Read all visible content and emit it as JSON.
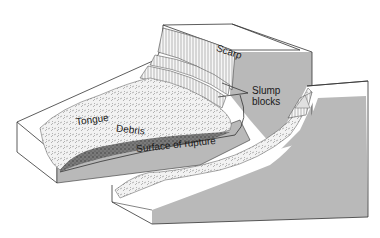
{
  "diagram": {
    "type": "block diagram",
    "labels": {
      "scarp": "Scarp",
      "slump_blocks_line1": "Slump",
      "slump_blocks_line2": "blocks",
      "tongue": "Tongue",
      "debris": "Debris",
      "surface_of_rupture": "Surface of rupture"
    },
    "colors": {
      "block_side": "#b9b9b9",
      "block_top": "#ffffff",
      "outline": "#333333",
      "debris": "#6e6e6e",
      "texture": "#e6e6e6"
    }
  }
}
